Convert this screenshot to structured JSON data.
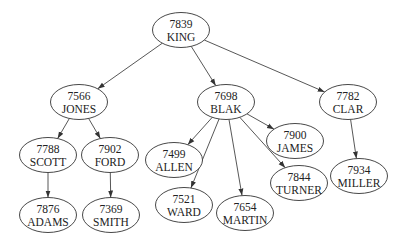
{
  "diagram": {
    "type": "tree",
    "nodes": [
      {
        "id": "7839",
        "name": "KING"
      },
      {
        "id": "7566",
        "name": "JONES"
      },
      {
        "id": "7698",
        "name": "BLAK"
      },
      {
        "id": "7782",
        "name": "CLAR"
      },
      {
        "id": "7788",
        "name": "SCOTT"
      },
      {
        "id": "7902",
        "name": "FORD"
      },
      {
        "id": "7499",
        "name": "ALLEN"
      },
      {
        "id": "7900",
        "name": "JAMES"
      },
      {
        "id": "7844",
        "name": "TURNER"
      },
      {
        "id": "7521",
        "name": "WARD"
      },
      {
        "id": "7654",
        "name": "MARTIN"
      },
      {
        "id": "7934",
        "name": "MILLER"
      },
      {
        "id": "7876",
        "name": "ADAMS"
      },
      {
        "id": "7369",
        "name": "SMITH"
      }
    ],
    "edges": [
      {
        "from": "7839",
        "to": "7566"
      },
      {
        "from": "7839",
        "to": "7698"
      },
      {
        "from": "7839",
        "to": "7782"
      },
      {
        "from": "7566",
        "to": "7788"
      },
      {
        "from": "7566",
        "to": "7902"
      },
      {
        "from": "7788",
        "to": "7876"
      },
      {
        "from": "7902",
        "to": "7369"
      },
      {
        "from": "7698",
        "to": "7499"
      },
      {
        "from": "7698",
        "to": "7521"
      },
      {
        "from": "7698",
        "to": "7654"
      },
      {
        "from": "7698",
        "to": "7844"
      },
      {
        "from": "7698",
        "to": "7900"
      },
      {
        "from": "7782",
        "to": "7934"
      }
    ]
  }
}
